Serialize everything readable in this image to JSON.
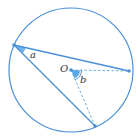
{
  "diagram": {
    "type": "circle-inscribed-angle",
    "colors": {
      "stroke": "#4a90d9",
      "fill_angle": "#5aa8e6",
      "dashed": "#6aaee0",
      "label": "#333333",
      "background": "#ffffff"
    },
    "circle": {
      "cx": 71,
      "cy": 70,
      "r": 62
    },
    "points": {
      "A": {
        "x": 14,
        "y": 45
      },
      "B": {
        "x": 129,
        "y": 71
      },
      "C": {
        "x": 95,
        "y": 126
      },
      "O": {
        "x": 71,
        "y": 70
      }
    },
    "labels": {
      "angle_a": "a",
      "center": "O",
      "angle_b": "b"
    }
  }
}
